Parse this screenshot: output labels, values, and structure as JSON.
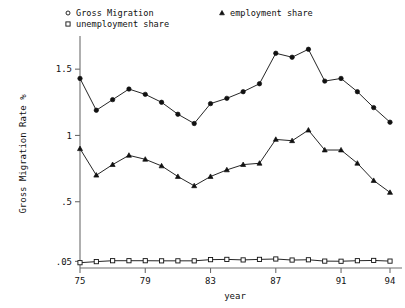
{
  "chart_data": {
    "type": "line",
    "title": "",
    "subtitle": "",
    "xlabel": "year",
    "ylabel": "Gross Migration Rate %",
    "xlim": [
      1975,
      1994
    ],
    "ylim": [
      0.0,
      1.72
    ],
    "grid": false,
    "legend_position": "top",
    "xticks": [
      1975,
      1979,
      1983,
      1987,
      1991,
      1994
    ],
    "xticklabels": [
      "75",
      "79",
      "83",
      "87",
      "91",
      "94"
    ],
    "yticks": [
      0.05,
      0.5,
      1,
      1.5
    ],
    "yticklabels": [
      ".05",
      ".5",
      "1",
      "1.5"
    ],
    "x": [
      1975,
      1976,
      1977,
      1978,
      1979,
      1980,
      1981,
      1982,
      1983,
      1984,
      1985,
      1986,
      1987,
      1988,
      1989,
      1990,
      1991,
      1992,
      1993,
      1994
    ],
    "series": [
      {
        "name": "Gross Migration",
        "marker": "circle",
        "values": [
          1.43,
          1.19,
          1.27,
          1.35,
          1.31,
          1.25,
          1.16,
          1.09,
          1.24,
          1.28,
          1.33,
          1.39,
          1.62,
          1.59,
          1.65,
          1.41,
          1.43,
          1.33,
          1.21,
          1.1
        ]
      },
      {
        "name": "employment share",
        "marker": "triangle",
        "values": [
          0.9,
          0.7,
          0.78,
          0.85,
          0.82,
          0.77,
          0.69,
          0.62,
          0.69,
          0.74,
          0.78,
          0.79,
          0.97,
          0.96,
          1.04,
          0.89,
          0.89,
          0.79,
          0.66,
          0.57
        ]
      },
      {
        "name": "unemployment share",
        "marker": "square",
        "values": [
          0.04,
          0.048,
          0.055,
          0.055,
          0.055,
          0.054,
          0.054,
          0.054,
          0.063,
          0.065,
          0.061,
          0.065,
          0.068,
          0.06,
          0.062,
          0.052,
          0.051,
          0.055,
          0.057,
          0.052
        ]
      }
    ]
  },
  "legend": {
    "items": [
      {
        "label": "Gross Migration",
        "marker": "circle"
      },
      {
        "label": "unemployment share",
        "marker": "square"
      },
      {
        "label": "employment share",
        "marker": "triangle"
      }
    ]
  },
  "axes": {
    "ylabel": "Gross Migration Rate %",
    "xlabel": "year"
  }
}
